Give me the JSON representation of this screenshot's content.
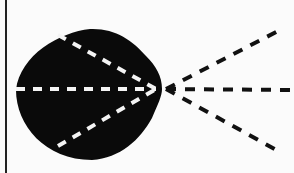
{
  "diagram": {
    "background": "#fbfbfb",
    "shape_color": "#0a0a0a",
    "inner_dash_color": "#f4f4f4",
    "outer_dash_color": "#111111",
    "border_line": {
      "x": 6,
      "y1": 0,
      "y2": 173,
      "color": "#222222",
      "width": 2
    },
    "focal_point": {
      "x": 160,
      "y": 89
    },
    "inner_lines": [
      {
        "name": "upper-inner-ray",
        "x1": 58,
        "y1": 35
      },
      {
        "name": "middle-inner-ray",
        "x1": 16,
        "y1": 89
      },
      {
        "name": "lower-inner-ray",
        "x1": 58,
        "y1": 146
      }
    ],
    "outer_lines": [
      {
        "name": "upper-outer-ray",
        "x2": 280,
        "y2": 30
      },
      {
        "name": "middle-outer-ray",
        "x2": 290,
        "y2": 90
      },
      {
        "name": "lower-outer-ray",
        "x2": 280,
        "y2": 152
      }
    ]
  }
}
